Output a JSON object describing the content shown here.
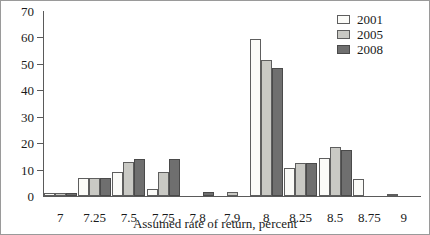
{
  "chart_data": {
    "type": "bar",
    "title": "",
    "xlabel": "Assumed rate of return, percent",
    "ylabel": "",
    "ylim": [
      0,
      70
    ],
    "yticks": [
      0,
      10,
      20,
      30,
      40,
      50,
      60,
      70
    ],
    "grid": false,
    "legend_position": "top-right",
    "categories": [
      "7",
      "7.25",
      "7.5",
      "7.75",
      "7.8",
      "7.9",
      "8",
      "8.25",
      "8.5",
      "8.75",
      "9"
    ],
    "series": [
      {
        "name": "2001",
        "color": "#fbfbf8",
        "values": [
          1,
          7,
          9,
          2.5,
          0,
          0,
          59.5,
          10.5,
          14.5,
          6.5,
          0.5
        ]
      },
      {
        "name": "2005",
        "color": "#c9c9c4",
        "values": [
          1,
          7,
          13,
          9,
          0,
          1.5,
          51.5,
          12.5,
          18.5,
          0,
          0
        ]
      },
      {
        "name": "2008",
        "color": "#6f6f6f",
        "values": [
          1,
          7,
          14,
          14,
          1.5,
          0,
          48.5,
          12.5,
          17.5,
          0,
          0
        ]
      }
    ]
  },
  "colors": {
    "axis": "#5a5a5a",
    "frame": "#9a9a9a",
    "text": "#1a1a1a",
    "series_2001": "#fbfbf8",
    "series_2005": "#c9c9c4",
    "series_2008": "#6f6f6f"
  }
}
